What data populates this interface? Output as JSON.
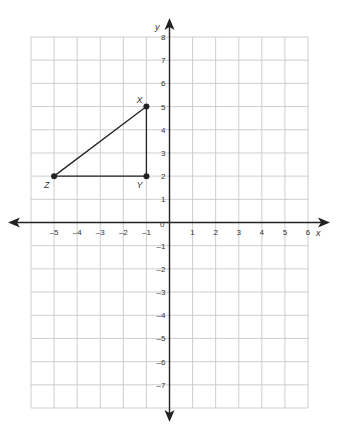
{
  "diagram": {
    "type": "coordinate-plane",
    "x_axis": {
      "label": "x",
      "min": -6,
      "max": 6,
      "tick_labels": [
        "-5",
        "-4",
        "-3",
        "-2",
        "-1",
        "1",
        "2",
        "3",
        "4",
        "5",
        "6"
      ]
    },
    "y_axis": {
      "label": "y",
      "min": -8,
      "max": 8,
      "tick_labels": [
        "8",
        "7",
        "6",
        "5",
        "4",
        "3",
        "2",
        "1",
        "-1",
        "-2",
        "-3",
        "-4",
        "-5",
        "-6",
        "-7"
      ]
    },
    "origin_label": "0",
    "grid_color": "#c8c8c8",
    "axis_color": "#222222",
    "shape_color": "#222222",
    "points": [
      {
        "label": "X",
        "x": -1,
        "y": 5
      },
      {
        "label": "Y",
        "x": -1,
        "y": 2
      },
      {
        "label": "Z",
        "x": -5,
        "y": 2
      }
    ],
    "segments": [
      [
        "Z",
        "X"
      ],
      [
        "X",
        "Y"
      ],
      [
        "Y",
        "Z"
      ]
    ]
  }
}
